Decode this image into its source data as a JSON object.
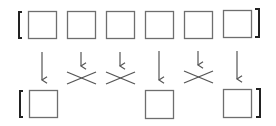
{
  "diagram": {
    "colors": {
      "box_stroke": "#6e6e6e",
      "bracket": "#222222",
      "arrow": "#555555",
      "cross": "#555555",
      "background": "#ffffff"
    },
    "top_row": {
      "cells": [
        {
          "x": 28,
          "y": 11
        },
        {
          "x": 67,
          "y": 11
        },
        {
          "x": 106,
          "y": 11
        },
        {
          "x": 145,
          "y": 11
        },
        {
          "x": 184,
          "y": 11
        },
        {
          "x": 223,
          "y": 10
        }
      ],
      "cell_size": 28
    },
    "transitions": [
      {
        "type": "keep",
        "x": 42
      },
      {
        "type": "drop",
        "x": 81
      },
      {
        "type": "drop",
        "x": 120
      },
      {
        "type": "keep",
        "x": 159
      },
      {
        "type": "drop",
        "x": 198
      },
      {
        "type": "keep",
        "x": 237
      }
    ],
    "bottom_row": {
      "cells": [
        {
          "x": 29,
          "y": 90,
          "source_index": 0
        },
        {
          "x": 145,
          "y": 90,
          "source_index": 3
        },
        {
          "x": 223,
          "y": 89,
          "source_index": 5
        }
      ],
      "cell_size": 28
    }
  }
}
